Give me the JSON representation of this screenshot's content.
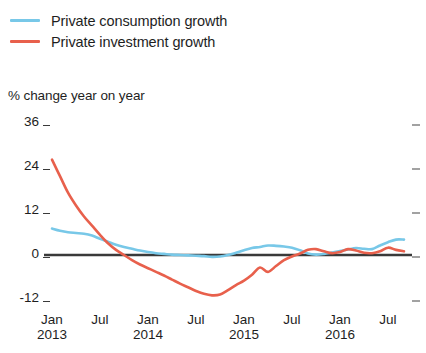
{
  "legend": {
    "position": "top-left",
    "items": [
      {
        "label": "Private consumption growth",
        "color": "#78c8e8",
        "icon": "line-swatch"
      },
      {
        "label": "Private investment growth",
        "color": "#e8604c",
        "icon": "line-swatch"
      }
    ]
  },
  "chart_data": {
    "type": "line",
    "title": "",
    "subtitle": "",
    "ylabel": "% change year on year",
    "xlabel": "",
    "ylim": [
      -12,
      36
    ],
    "yticks": [
      36,
      24,
      12,
      0,
      -12
    ],
    "ytick_labels": [
      "36",
      "24",
      "12",
      "0",
      "-12"
    ],
    "grid": false,
    "zero_line": true,
    "x_major_labels": [
      {
        "month": "Jan",
        "year": "2013"
      },
      {
        "month": "Jul",
        "year": ""
      },
      {
        "month": "Jan",
        "year": "2014"
      },
      {
        "month": "Jul",
        "year": ""
      },
      {
        "month": "Jan",
        "year": "2015"
      },
      {
        "month": "Jul",
        "year": ""
      },
      {
        "month": "Jan",
        "year": "2016"
      },
      {
        "month": "Jul",
        "year": ""
      }
    ],
    "x": [
      "2013-01",
      "2013-02",
      "2013-03",
      "2013-04",
      "2013-05",
      "2013-06",
      "2013-07",
      "2013-08",
      "2013-09",
      "2013-10",
      "2013-11",
      "2013-12",
      "2014-01",
      "2014-02",
      "2014-03",
      "2014-04",
      "2014-05",
      "2014-06",
      "2014-07",
      "2014-08",
      "2014-09",
      "2014-10",
      "2014-11",
      "2014-12",
      "2015-01",
      "2015-02",
      "2015-03",
      "2015-04",
      "2015-05",
      "2015-06",
      "2015-07",
      "2015-08",
      "2015-09",
      "2015-10",
      "2015-11",
      "2015-12",
      "2016-01",
      "2016-02",
      "2016-03",
      "2016-04",
      "2016-05",
      "2016-06",
      "2016-07",
      "2016-08",
      "2016-09"
    ],
    "series": [
      {
        "name": "Private consumption growth",
        "color": "#78c8e8",
        "values": [
          7.2,
          6.6,
          6.2,
          6.0,
          5.8,
          5.3,
          4.4,
          3.6,
          2.8,
          2.2,
          1.7,
          1.2,
          0.8,
          0.5,
          0.3,
          0.1,
          0.0,
          -0.1,
          -0.2,
          -0.3,
          -0.5,
          -0.4,
          0.0,
          0.6,
          1.3,
          1.9,
          2.2,
          2.6,
          2.5,
          2.3,
          2.0,
          1.3,
          0.4,
          0.1,
          0.3,
          0.7,
          1.1,
          1.5,
          1.9,
          1.7,
          1.6,
          2.6,
          3.5,
          4.2,
          4.2
        ]
      },
      {
        "name": "Private investment growth",
        "color": "#e8604c",
        "values": [
          26.0,
          21.5,
          17.0,
          13.5,
          10.5,
          8.0,
          5.5,
          3.2,
          1.4,
          0.0,
          -1.4,
          -2.6,
          -3.6,
          -4.6,
          -5.6,
          -6.7,
          -7.8,
          -8.8,
          -9.8,
          -10.6,
          -11.0,
          -10.8,
          -9.6,
          -8.2,
          -7.0,
          -5.4,
          -3.4,
          -4.6,
          -3.0,
          -1.4,
          -0.4,
          0.4,
          1.4,
          1.6,
          1.0,
          0.5,
          0.8,
          1.6,
          1.2,
          0.6,
          0.5,
          1.0,
          2.0,
          1.4,
          1.0
        ]
      }
    ]
  },
  "plot_geometry": {
    "left": 52,
    "right": 404,
    "top": 123,
    "bottom": 299,
    "value_top": 36,
    "value_bottom": -12
  }
}
